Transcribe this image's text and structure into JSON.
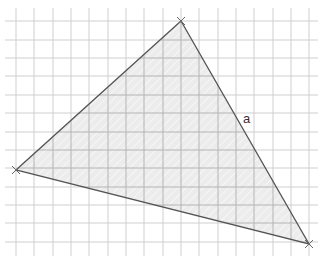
{
  "diagram": {
    "type": "triangle-on-grid",
    "grid": {
      "x_lines": [
        16,
        34,
        53,
        71,
        89,
        108,
        126,
        144,
        163,
        181,
        199,
        218,
        236,
        254,
        273,
        291,
        309
      ],
      "y_lines": [
        21,
        40,
        58,
        76,
        95,
        113,
        132,
        150,
        168,
        187,
        205,
        223,
        242
      ],
      "x_extent": [
        5,
        318
      ],
      "y_extent": [
        8,
        256
      ],
      "color": "#cfcfcf"
    },
    "triangle": {
      "vertices": [
        {
          "name": "top",
          "x": 181,
          "y": 21
        },
        {
          "name": "left",
          "x": 16,
          "y": 170
        },
        {
          "name": "bottom-right",
          "x": 309,
          "y": 244
        }
      ],
      "fill": "#ececec",
      "stroke": "#555555"
    },
    "side_label": {
      "text": "a",
      "x": 243,
      "y": 123
    }
  }
}
